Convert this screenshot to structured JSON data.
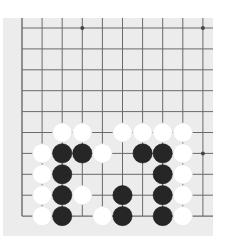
{
  "board": {
    "background": "#ececec",
    "line_color": "#6a6a6a",
    "black_color": "#262626",
    "white_color": "#ffffff",
    "columns_visible": 10,
    "rows_visible": 10,
    "left_edge": true,
    "bottom_edge": true,
    "star_points": [
      [
        9,
        0
      ],
      [
        9,
        6
      ],
      [
        3,
        0
      ]
    ],
    "stones": [
      {
        "col": 2,
        "row": 5,
        "color": "white"
      },
      {
        "col": 3,
        "row": 5,
        "color": "white"
      },
      {
        "col": 5,
        "row": 5,
        "color": "white"
      },
      {
        "col": 6,
        "row": 5,
        "color": "white"
      },
      {
        "col": 7,
        "row": 5,
        "color": "white"
      },
      {
        "col": 8,
        "row": 5,
        "color": "white"
      },
      {
        "col": 1,
        "row": 6,
        "color": "white"
      },
      {
        "col": 2,
        "row": 6,
        "color": "black"
      },
      {
        "col": 3,
        "row": 6,
        "color": "black"
      },
      {
        "col": 4,
        "row": 6,
        "color": "white"
      },
      {
        "col": 6,
        "row": 6,
        "color": "black"
      },
      {
        "col": 7,
        "row": 6,
        "color": "black"
      },
      {
        "col": 8,
        "row": 6,
        "color": "white"
      },
      {
        "col": 1,
        "row": 7,
        "color": "white"
      },
      {
        "col": 2,
        "row": 7,
        "color": "black"
      },
      {
        "col": 7,
        "row": 7,
        "color": "black"
      },
      {
        "col": 8,
        "row": 7,
        "color": "white"
      },
      {
        "col": 1,
        "row": 8,
        "color": "white"
      },
      {
        "col": 2,
        "row": 8,
        "color": "black"
      },
      {
        "col": 3,
        "row": 8,
        "color": "white"
      },
      {
        "col": 5,
        "row": 8,
        "color": "black"
      },
      {
        "col": 7,
        "row": 8,
        "color": "black"
      },
      {
        "col": 8,
        "row": 8,
        "color": "white"
      },
      {
        "col": 1,
        "row": 9,
        "color": "white"
      },
      {
        "col": 2,
        "row": 9,
        "color": "black"
      },
      {
        "col": 4,
        "row": 9,
        "color": "white"
      },
      {
        "col": 5,
        "row": 9,
        "color": "black"
      },
      {
        "col": 7,
        "row": 9,
        "color": "black"
      },
      {
        "col": 8,
        "row": 9,
        "color": "white"
      }
    ]
  }
}
